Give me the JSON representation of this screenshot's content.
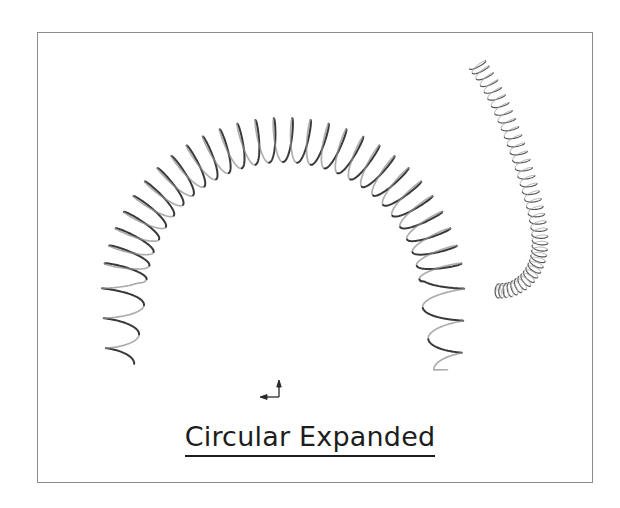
{
  "figure": {
    "caption": "Circular Expanded",
    "caption_underlined": true,
    "frame": {
      "border_color": "#8c8c8c",
      "background_color": "#ffffff",
      "x": 37,
      "y": 32,
      "width": 556,
      "height": 451
    },
    "background_color": "#ffffff",
    "ink_color": "#3a3a3a",
    "objects": [
      {
        "name": "large-circular-spring",
        "description": "Large helical compression spring bent into a circular arc opening downward",
        "form": "circular expanded",
        "coil_count": 34,
        "arc_center_x": 283,
        "arc_center_y": 300,
        "arc_radius": 160,
        "arc_start_deg": 188,
        "arc_end_deg": 352,
        "coil_amplitude": 22,
        "stroke_width": 2.0
      },
      {
        "name": "small-circular-spring",
        "description": "Smaller fine-pitch helical spring curving down from upper right and hooking left at its lower end",
        "form": "circular expanded",
        "coil_count": 40,
        "coil_amplitude": 9,
        "stroke_width": 1.2
      }
    ],
    "axis_marker": {
      "name": "coordinate-axis-marker",
      "x": 275,
      "y": 392,
      "horizontal_direction": "left",
      "vertical_direction": "up"
    }
  }
}
